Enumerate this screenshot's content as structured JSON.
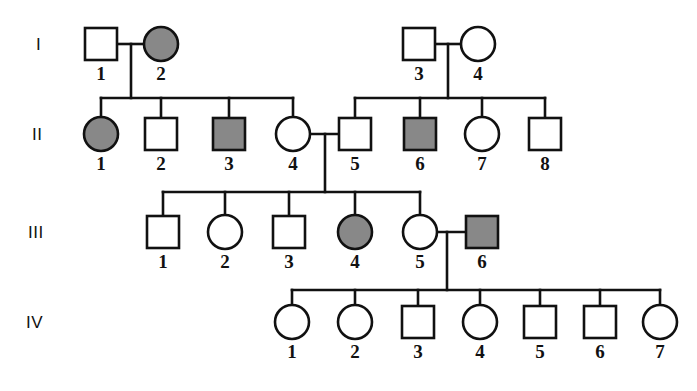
{
  "figure": {
    "kind": "pedigree-chart",
    "width": 697,
    "height": 391,
    "background_color": "#ffffff",
    "line_color": "#111111",
    "affected_fill_color": "#888888",
    "unaffected_fill_color": "#ffffff"
  },
  "legend_semantics": {
    "square": "male",
    "circle": "female",
    "filled_gray": "affected",
    "open_white": "unaffected"
  },
  "generations": [
    {
      "label": "I",
      "label_x": 36,
      "label_y": 50,
      "row_y": 44,
      "individuals": [
        {
          "id": "1",
          "sex": "male",
          "shape": "square",
          "affected": false,
          "x": 101,
          "label_x": 101,
          "label_y": 80
        },
        {
          "id": "2",
          "sex": "female",
          "shape": "circle",
          "affected": true,
          "x": 161,
          "label_x": 161,
          "label_y": 80
        },
        {
          "id": "3",
          "sex": "male",
          "shape": "square",
          "affected": false,
          "x": 419,
          "label_x": 419,
          "label_y": 80
        },
        {
          "id": "4",
          "sex": "female",
          "shape": "circle",
          "affected": false,
          "x": 478,
          "label_x": 478,
          "label_y": 80
        }
      ]
    },
    {
      "label": "II",
      "label_x": 32,
      "label_y": 140,
      "row_y": 134,
      "individuals": [
        {
          "id": "1",
          "sex": "female",
          "shape": "circle",
          "affected": true,
          "x": 101,
          "label_x": 101,
          "label_y": 170
        },
        {
          "id": "2",
          "sex": "male",
          "shape": "square",
          "affected": false,
          "x": 161,
          "label_x": 161,
          "label_y": 170
        },
        {
          "id": "3",
          "sex": "male",
          "shape": "square",
          "affected": true,
          "x": 229,
          "label_x": 229,
          "label_y": 170
        },
        {
          "id": "4",
          "sex": "female",
          "shape": "circle",
          "affected": false,
          "x": 293,
          "label_x": 293,
          "label_y": 170
        },
        {
          "id": "5",
          "sex": "male",
          "shape": "square",
          "affected": false,
          "x": 355,
          "label_x": 355,
          "label_y": 170
        },
        {
          "id": "6",
          "sex": "male",
          "shape": "square",
          "affected": true,
          "x": 420,
          "label_x": 420,
          "label_y": 170
        },
        {
          "id": "7",
          "sex": "female",
          "shape": "circle",
          "affected": false,
          "x": 482,
          "label_x": 482,
          "label_y": 170
        },
        {
          "id": "8",
          "sex": "male",
          "shape": "square",
          "affected": false,
          "x": 545,
          "label_x": 545,
          "label_y": 170
        }
      ]
    },
    {
      "label": "III",
      "label_x": 28,
      "label_y": 238,
      "row_y": 232,
      "individuals": [
        {
          "id": "1",
          "sex": "male",
          "shape": "square",
          "affected": false,
          "x": 163,
          "label_x": 163,
          "label_y": 268
        },
        {
          "id": "2",
          "sex": "female",
          "shape": "circle",
          "affected": false,
          "x": 225,
          "label_x": 225,
          "label_y": 268
        },
        {
          "id": "3",
          "sex": "male",
          "shape": "square",
          "affected": false,
          "x": 289,
          "label_x": 289,
          "label_y": 268
        },
        {
          "id": "4",
          "sex": "female",
          "shape": "circle",
          "affected": true,
          "x": 355,
          "label_x": 355,
          "label_y": 268
        },
        {
          "id": "5",
          "sex": "female",
          "shape": "circle",
          "affected": false,
          "x": 420,
          "label_x": 420,
          "label_y": 268
        },
        {
          "id": "6",
          "sex": "male",
          "shape": "square",
          "affected": true,
          "x": 482,
          "label_x": 482,
          "label_y": 268
        }
      ]
    },
    {
      "label": "IV",
      "label_x": 26,
      "label_y": 328,
      "row_y": 322,
      "individuals": [
        {
          "id": "1",
          "sex": "female",
          "shape": "circle",
          "affected": false,
          "x": 292,
          "label_x": 292,
          "label_y": 358
        },
        {
          "id": "2",
          "sex": "female",
          "shape": "circle",
          "affected": false,
          "x": 355,
          "label_x": 355,
          "label_y": 358
        },
        {
          "id": "3",
          "sex": "male",
          "shape": "square",
          "affected": false,
          "x": 418,
          "label_x": 418,
          "label_y": 358
        },
        {
          "id": "4",
          "sex": "female",
          "shape": "circle",
          "affected": false,
          "x": 480,
          "label_x": 480,
          "label_y": 358
        },
        {
          "id": "5",
          "sex": "male",
          "shape": "square",
          "affected": false,
          "x": 540,
          "label_x": 540,
          "label_y": 358
        },
        {
          "id": "6",
          "sex": "male",
          "shape": "square",
          "affected": false,
          "x": 600,
          "label_x": 600,
          "label_y": 358
        },
        {
          "id": "7",
          "sex": "female",
          "shape": "circle",
          "affected": false,
          "x": 660,
          "label_x": 660,
          "label_y": 358
        }
      ]
    }
  ],
  "matings": [
    {
      "name": "I-1 x I-2",
      "partner_a": "I-1",
      "partner_b": "I-2",
      "x1": 117,
      "x2": 145,
      "y": 44,
      "drop_x": 131,
      "drop_y2": 98
    },
    {
      "name": "I-3 x I-4",
      "partner_a": "I-3",
      "partner_b": "I-4",
      "x1": 435,
      "x2": 462,
      "y": 44,
      "drop_x": 448,
      "drop_y2": 98
    },
    {
      "name": "II-4 x II-5",
      "partner_a": "II-4",
      "partner_b": "II-5",
      "x1": 309,
      "x2": 339,
      "y": 134,
      "drop_x": 325,
      "drop_y2": 192
    },
    {
      "name": "III-5 x III-6",
      "partner_a": "III-5",
      "partner_b": "III-6",
      "x1": 436,
      "x2": 466,
      "y": 232,
      "drop_x": 447,
      "drop_y2": 290
    }
  ],
  "sibships": [
    {
      "name": "gen-II-left-sibship",
      "bar_y": 98,
      "bar_x1": 101,
      "bar_x2": 293,
      "child_x": [
        101,
        161,
        229,
        293
      ],
      "child_y": 118
    },
    {
      "name": "gen-II-right-sibship",
      "bar_y": 98,
      "bar_x1": 355,
      "bar_x2": 545,
      "child_x": [
        355,
        420,
        482,
        545
      ],
      "child_y": 118
    },
    {
      "name": "gen-III-sibship",
      "bar_y": 192,
      "bar_x1": 163,
      "bar_x2": 420,
      "child_x": [
        163,
        225,
        289,
        355,
        420
      ],
      "child_y": 216
    },
    {
      "name": "gen-IV-sibship",
      "bar_y": 290,
      "bar_x1": 292,
      "bar_x2": 660,
      "child_x": [
        292,
        355,
        418,
        480,
        540,
        600,
        660
      ],
      "child_y": 306
    }
  ],
  "symbol_size": {
    "square_side": 32,
    "circle_radius": 17
  }
}
